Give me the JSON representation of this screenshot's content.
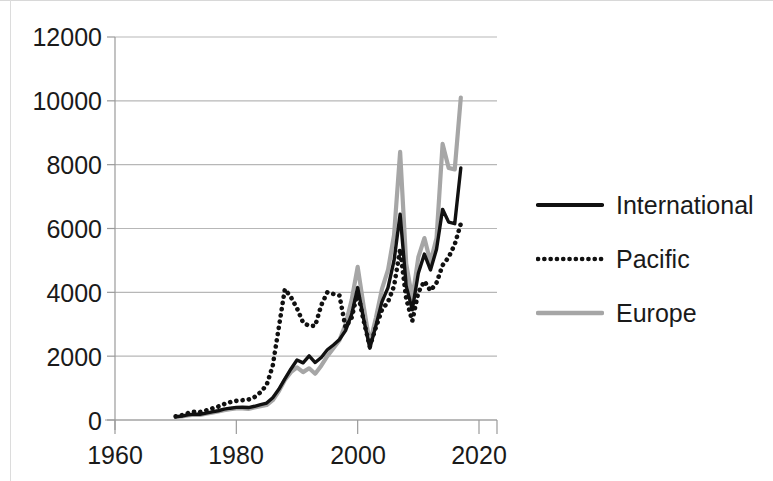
{
  "chart_data": {
    "type": "line",
    "title": "",
    "xlabel": "",
    "ylabel": "",
    "xlim": [
      1955,
      2022
    ],
    "ylim": [
      0,
      12000
    ],
    "grid": true,
    "legend_position": "right",
    "x_ticks": [
      "1960",
      "1980",
      "2000",
      "2020"
    ],
    "x_tick_values": [
      1960,
      1980,
      2000,
      2020
    ],
    "y_ticks": [
      "0",
      "2000",
      "4000",
      "6000",
      "8000",
      "10000",
      "12000"
    ],
    "y_tick_values": [
      0,
      2000,
      4000,
      6000,
      8000,
      10000,
      12000
    ],
    "x": [
      1970,
      1971,
      1972,
      1973,
      1974,
      1975,
      1976,
      1977,
      1978,
      1979,
      1980,
      1981,
      1982,
      1983,
      1984,
      1985,
      1986,
      1987,
      1988,
      1989,
      1990,
      1991,
      1992,
      1993,
      1994,
      1995,
      1996,
      1997,
      1998,
      1999,
      2000,
      2001,
      2002,
      2003,
      2004,
      2005,
      2006,
      2007,
      2008,
      2009,
      2010,
      2011,
      2012,
      2013,
      2014,
      2015,
      2016,
      2017
    ],
    "series": [
      {
        "name": "International",
        "style": "solid",
        "color": "#111111",
        "values": [
          100,
          120,
          160,
          185,
          180,
          215,
          255,
          290,
          340,
          370,
          395,
          400,
          390,
          430,
          480,
          530,
          700,
          960,
          1290,
          1600,
          1880,
          1790,
          2010,
          1800,
          1960,
          2200,
          2350,
          2520,
          2800,
          3300,
          4150,
          3150,
          2250,
          2950,
          3700,
          4150,
          5000,
          6450,
          4200,
          3450,
          4600,
          5200,
          4700,
          5350,
          6600,
          6200,
          6150,
          7900
        ]
      },
      {
        "name": "Pacific",
        "style": "dotted",
        "color": "#111111",
        "values": [
          115,
          150,
          215,
          260,
          250,
          300,
          360,
          420,
          500,
          560,
          600,
          620,
          640,
          720,
          870,
          1100,
          1700,
          2900,
          4100,
          3850,
          3500,
          3050,
          2950,
          2950,
          3600,
          4000,
          3950,
          3900,
          2900,
          3200,
          4000,
          3100,
          2300,
          2900,
          3450,
          3700,
          4200,
          5350,
          3800,
          3100,
          4000,
          4350,
          4050,
          4300,
          4850,
          5100,
          5500,
          6150
        ]
      },
      {
        "name": "Europe",
        "style": "solid",
        "color": "#a6a6a6",
        "values": [
          95,
          110,
          145,
          170,
          160,
          195,
          230,
          265,
          310,
          340,
          360,
          365,
          350,
          390,
          430,
          470,
          620,
          900,
          1250,
          1500,
          1650,
          1500,
          1620,
          1450,
          1700,
          2000,
          2250,
          2500,
          3000,
          3750,
          4800,
          3550,
          2400,
          3200,
          4100,
          4700,
          5800,
          8400,
          4900,
          3800,
          5100,
          5700,
          4950,
          5700,
          8650,
          7900,
          7850,
          10100
        ]
      }
    ]
  },
  "axes": {
    "y_labels": [
      "12000",
      "10000",
      "8000",
      "6000",
      "4000",
      "2000",
      "0"
    ],
    "x_labels": [
      "1960",
      "1980",
      "2000",
      "2020"
    ]
  },
  "legend": {
    "items": [
      {
        "label": "International",
        "swatch": "solid-black-line-swatch"
      },
      {
        "label": "Pacific",
        "swatch": "dotted-black-line-swatch"
      },
      {
        "label": "Europe",
        "swatch": "solid-gray-line-swatch"
      }
    ]
  },
  "colors": {
    "international": "#111111",
    "pacific": "#111111",
    "europe": "#a6a6a6",
    "gridline": "#b7b7b7",
    "axis": "#9a9a9a",
    "text": "#1a1a1a",
    "background": "#ffffff"
  }
}
